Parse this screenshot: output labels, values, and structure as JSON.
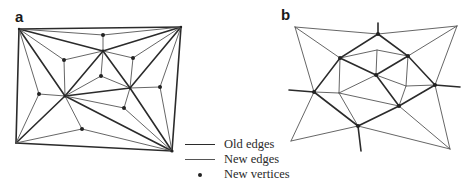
{
  "panels": [
    {
      "id": "a",
      "label": "a"
    },
    {
      "id": "b",
      "label": "b"
    }
  ],
  "legend": [
    {
      "key": "old_edges",
      "label": "Old edges"
    },
    {
      "key": "new_edges",
      "label": "New edges"
    },
    {
      "key": "new_vertices",
      "label": "New vertices"
    }
  ],
  "colors": {
    "old_edge": "#2b2b2b",
    "new_edge": "#555555",
    "vertex": "#222222",
    "background": "#ffffff"
  },
  "panel_a": {
    "old_vertices": {
      "TL": [
        19,
        29
      ],
      "TR": [
        181,
        27
      ],
      "BL": [
        16,
        143
      ],
      "BR": [
        172,
        151
      ],
      "A": [
        103,
        51
      ],
      "B": [
        65,
        96
      ],
      "C": [
        130,
        88
      ]
    },
    "new_vertices": [
      [
        103,
        35
      ],
      [
        64,
        60
      ],
      [
        133,
        58
      ],
      [
        101,
        76
      ],
      [
        39,
        94
      ],
      [
        160,
        87
      ],
      [
        124,
        108
      ],
      [
        82,
        129
      ]
    ]
  },
  "panel_b": {
    "old_vertices": {
      "TL": [
        295,
        27
      ],
      "TR": [
        457,
        26
      ],
      "BL": [
        291,
        141
      ],
      "BR": [
        450,
        149
      ]
    },
    "new_vertices": [
      [
        378,
        34
      ],
      [
        340,
        58
      ],
      [
        408,
        56
      ],
      [
        376,
        75
      ],
      [
        314,
        92
      ],
      [
        435,
        85
      ],
      [
        399,
        106
      ],
      [
        358,
        126
      ]
    ]
  }
}
